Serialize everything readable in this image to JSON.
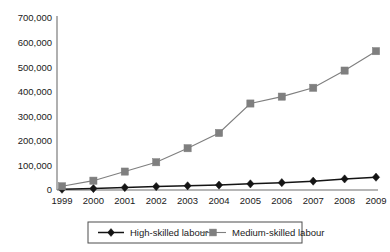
{
  "chart_data": {
    "type": "line",
    "title": "",
    "subtitle": "",
    "xlabel": "",
    "ylabel": "",
    "categories": [
      "1999",
      "2000",
      "2001",
      "2002",
      "2003",
      "2004",
      "2005",
      "2006",
      "2007",
      "2008",
      "2009"
    ],
    "series": [
      {
        "name": "High-skilled labour",
        "marker": "diamond",
        "color": "#141414",
        "values": [
          3000,
          6000,
          10000,
          14000,
          17000,
          20000,
          25000,
          30000,
          36000,
          45000,
          52000
        ]
      },
      {
        "name": "Medium-skilled labour",
        "marker": "square",
        "color": "#7f7f7f",
        "values": [
          15000,
          38000,
          75000,
          113000,
          170000,
          232000,
          352000,
          380000,
          416000,
          486000,
          565000
        ]
      }
    ],
    "ylim": [
      0,
      700000
    ],
    "ytick_values": [
      0,
      100000,
      200000,
      300000,
      400000,
      500000,
      600000,
      700000
    ],
    "ytick_labels": [
      "0",
      "100,000",
      "200,000",
      "300,000",
      "400,000",
      "500,000",
      "600,000",
      "700,000"
    ],
    "grid": false,
    "legend_position": "bottom",
    "axis_color": "#6f6f6f"
  },
  "legend": {
    "items": [
      {
        "label": "High-skilled labour",
        "marker": "diamond",
        "color": "#141414"
      },
      {
        "label": "Medium-skilled labour",
        "marker": "square",
        "color": "#7f7f7f"
      }
    ]
  }
}
